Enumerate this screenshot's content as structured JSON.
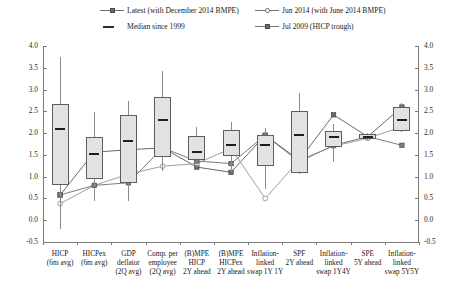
{
  "chart_data": {
    "type": "bar",
    "chart_style": "box-and-whisker with overlaid marker series",
    "title": "",
    "subtitle": "",
    "xlabel": "",
    "ylabel": "",
    "ylim": [
      -0.5,
      4.0
    ],
    "ytick_step": 0.5,
    "yticks": [
      "4.0",
      "3.5",
      "3.0",
      "2.5",
      "2.0",
      "1.5",
      "1.0",
      "0.5",
      "0.0",
      "-0.5"
    ],
    "grid": false,
    "dual_y_axis": true,
    "legend_position": "top",
    "legend": [
      {
        "label": "Latest (with December 2014 BMPE)",
        "marker": "filled-square-line",
        "color": "#6a6a6a"
      },
      {
        "label": "Jun 2014 (with June 2014 BMPE)",
        "marker": "open-circle-line",
        "color": "#9a9a9a"
      },
      {
        "label": "Median since 1999",
        "marker": "short-thick-dash",
        "color": "#2b2b2b"
      },
      {
        "label": "Jul 2009 (HICP trough)",
        "marker": "filled-square-line",
        "color": "#777777"
      }
    ],
    "categories": [
      "HICP (6m avg)",
      "HICPex (6m avg)",
      "GDP deflator (2Q avg)",
      "Comp. per employee (2Q avg)",
      "(B)MPE HICP 2Y ahead",
      "(B)MPE HICPex 2Y ahead",
      "Inflation-linked swap 1Y 1Y",
      "SPF 2Y ahead",
      "Inflation-linked swap 1Y4Y",
      "SPE 5Y ahead",
      "Inflation-linked swap 5Y5Y"
    ],
    "category_lines": [
      [
        "HICP",
        "(6m avg)"
      ],
      [
        "HICPex",
        "(6m avg)"
      ],
      [
        "GDP",
        "deflator",
        "(2Q avg)"
      ],
      [
        "Comp. per",
        "employee",
        "(2Q avg)"
      ],
      [
        "(B)MPE",
        "HICP",
        "2Y ahead"
      ],
      [
        "(B)MPE",
        "HICPex",
        "2Y ahead"
      ],
      [
        "Inflation-",
        "linked",
        "swap 1Y 1Y"
      ],
      [
        "SPF",
        "2Y ahead"
      ],
      [
        "Inflation-",
        "linked",
        "swap 1Y4Y"
      ],
      [
        "SPE",
        "5Y ahead"
      ],
      [
        "Inflation-",
        "linked",
        "swap 5Y5Y"
      ]
    ],
    "boxes": [
      {
        "category": "HICP (6m avg)",
        "whisker_low": -0.2,
        "q1": 0.82,
        "median": 2.1,
        "q3": 2.66,
        "whisker_high": 3.74
      },
      {
        "category": "HICPex (6m avg)",
        "whisker_low": 0.45,
        "q1": 0.95,
        "median": 1.52,
        "q3": 1.9,
        "whisker_high": 2.48
      },
      {
        "category": "GDP deflator (2Q avg)",
        "whisker_low": 0.44,
        "q1": 0.86,
        "median": 1.81,
        "q3": 2.42,
        "whisker_high": 2.73
      },
      {
        "category": "Comp. per employee (2Q avg)",
        "whisker_low": 1.14,
        "q1": 1.45,
        "median": 2.31,
        "q3": 2.84,
        "whisker_high": 3.42
      },
      {
        "category": "(B)MPE HICP 2Y ahead",
        "whisker_low": 1.22,
        "q1": 1.38,
        "median": 1.56,
        "q3": 1.93,
        "whisker_high": 2.13
      },
      {
        "category": "(B)MPE HICPex 2Y ahead",
        "whisker_low": 1.1,
        "q1": 1.47,
        "median": 1.73,
        "q3": 2.08,
        "whisker_high": 2.26
      },
      {
        "category": "Inflation-linked swap 1Y 1Y",
        "whisker_low": 0.72,
        "q1": 1.25,
        "median": 1.72,
        "q3": 1.95,
        "whisker_high": 2.12
      },
      {
        "category": "SPF 2Y ahead",
        "whisker_low": 1.05,
        "q1": 1.08,
        "median": 1.95,
        "q3": 2.5,
        "whisker_high": 2.93
      },
      {
        "category": "Inflation-linked swap 1Y4Y",
        "whisker_low": 1.34,
        "q1": 1.68,
        "median": 1.92,
        "q3": 2.04,
        "whisker_high": 2.22
      },
      {
        "category": "SPE 5Y ahead",
        "whisker_low": 1.85,
        "q1": 1.87,
        "median": 1.92,
        "q3": 1.97,
        "whisker_high": 2.0
      },
      {
        "category": "Inflation-linked swap 5Y5Y",
        "whisker_low": 2.02,
        "q1": 2.05,
        "median": 2.3,
        "q3": 2.6,
        "whisker_high": 2.7
      }
    ],
    "series": [
      {
        "name": "Latest (with December 2014 BMPE)",
        "marker": "filled-square",
        "color": "#6a6a6a",
        "values": [
          0.58,
          1.56,
          1.62,
          1.66,
          1.22,
          1.1,
          1.95,
          1.38,
          2.42,
          1.92,
          2.6
        ]
      },
      {
        "name": "Jun 2014 (with June 2014 BMPE)",
        "marker": "open-circle",
        "color": "#9e9e9e",
        "values": [
          0.38,
          0.8,
          1.06,
          1.24,
          1.3,
          1.65,
          0.5,
          1.38,
          1.7,
          1.88,
          2.15
        ]
      },
      {
        "name": "Jul 2009 (HICP trough)",
        "marker": "filled-square",
        "color": "#7d7d7d",
        "values": [
          0.58,
          0.8,
          0.86,
          1.66,
          1.36,
          1.3,
          1.95,
          1.34,
          1.72,
          1.92,
          1.72
        ]
      }
    ]
  }
}
